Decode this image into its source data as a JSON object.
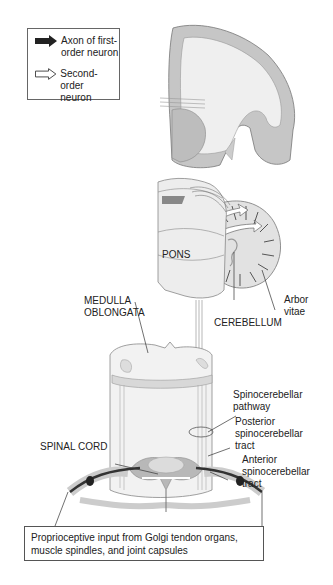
{
  "legend": {
    "items": [
      {
        "icon": "filled-arrow-icon",
        "label_line1": "Axon of first-",
        "label_line2": "order neuron"
      },
      {
        "icon": "outline-arrow-icon",
        "label_line1": "Second-order",
        "label_line2": "neuron"
      }
    ]
  },
  "labels": {
    "pons": "PONS",
    "medulla_line1": "MEDULLA",
    "medulla_line2": "OBLONGATA",
    "cerebellum": "CEREBELLUM",
    "arbor_line1": "Arbor",
    "arbor_line2": "vitae",
    "spinocerebellar_pathway_line1": "Spinocerebellar",
    "spinocerebellar_pathway_line2": "pathway",
    "posterior_line1": "Posterior",
    "posterior_line2": "spinocerebellar",
    "posterior_line3": "tract",
    "anterior_line1": "Anterior",
    "anterior_line2": "spinocerebellar",
    "anterior_line3": "tract",
    "spinal_cord": "SPINAL CORD"
  },
  "caption": {
    "line1": "Proprioceptive input from Golgi tendon organs,",
    "line2": "muscle spindles, and joint capsules"
  },
  "colors": {
    "gray_matter": "#b8b8b8",
    "white_matter": "#ececec",
    "outline": "#777777",
    "axon_dark": "#333333"
  }
}
